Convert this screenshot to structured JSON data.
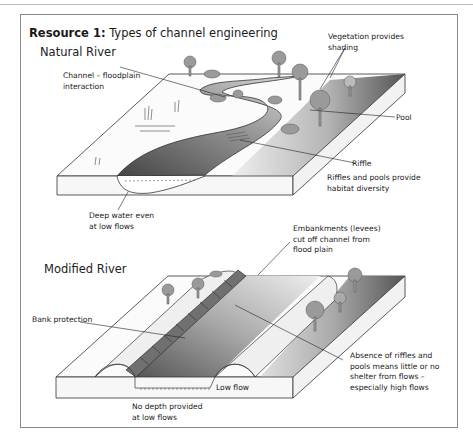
{
  "resource": {
    "title_bold": "Resource 1:",
    "title_rest": " Types of channel engineering"
  },
  "natural": {
    "heading": "Natural River",
    "labels": {
      "vegetation": "Vegetation provides\nshading",
      "channel": "Channel – floodplain\ninteraction",
      "pool": "Pool",
      "riffle": "Riffle",
      "riffles_pools": "Riffles and pools provide\nhabitat diversity",
      "deep_water": "Deep water even\nat low flows"
    }
  },
  "modified": {
    "heading": "Modified River",
    "labels": {
      "embankments": "Embankments (levees)\ncut off channel from\nflood plain",
      "bank_protection": "Bank protection",
      "absence": "Absence of riffles and\npools means little or no\nshelter from flows –\nespecially high flows",
      "low_flow": "Low flow",
      "no_depth": "No depth provided\nat low flows"
    }
  },
  "colors": {
    "frame": "#8a8a8a",
    "dark_water": "#5a5a5a",
    "block_side": "#f7f7f7",
    "tree": "#9a9a9a"
  }
}
